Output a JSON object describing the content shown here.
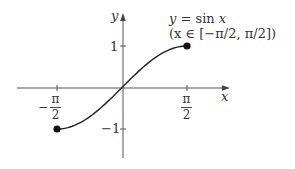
{
  "figure": {
    "curve_label": "y = sin x",
    "curve_label_parts": {
      "y": "y",
      "eq": " = sin ",
      "x": "x"
    },
    "domain_label": "(x ∈ [−π/2, π/2])",
    "axis_x_label": "x",
    "axis_y_label": "y",
    "y_tick_pos_label": "1",
    "y_tick_neg_label": "−1",
    "x_tick_neg": {
      "sign": "−",
      "num": "π",
      "den": "2"
    },
    "x_tick_pos": {
      "num": "π",
      "den": "2"
    },
    "colors": {
      "axis": "#555555",
      "curve": "#222222",
      "text": "#333333",
      "point": "#111111"
    }
  },
  "chart_data": {
    "type": "line",
    "title": "y = sin x (x ∈ [−π/2, π/2])",
    "xlabel": "x",
    "ylabel": "y",
    "x_ticks": [
      "−π/2",
      "π/2"
    ],
    "y_ticks": [
      "1",
      "−1"
    ],
    "xlim": [
      -2.2,
      2.45
    ],
    "ylim": [
      -1.7,
      1.0
    ],
    "grid": false,
    "legend": "none",
    "series": [
      {
        "name": "sin x",
        "x": [
          -1.5708,
          -1.1781,
          -0.7854,
          -0.3927,
          0,
          0.3927,
          0.7854,
          1.1781,
          1.5708
        ],
        "y": [
          -1,
          -0.9239,
          -0.7071,
          -0.3827,
          0,
          0.3827,
          0.7071,
          0.9239,
          1
        ]
      }
    ],
    "endpoints": [
      {
        "x": -1.5708,
        "y": -1,
        "label": "closed"
      },
      {
        "x": 1.5708,
        "y": 1,
        "label": "closed"
      }
    ]
  }
}
